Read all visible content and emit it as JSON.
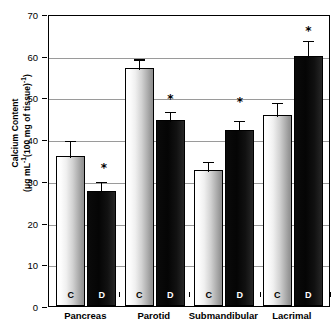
{
  "chart_data": {
    "type": "bar",
    "title": "",
    "xlabel": "",
    "ylabel_line1": "Calcium Content",
    "ylabel_line2_prefix": "(μg mL",
    "ylabel_line2_sup1": "-1",
    "ylabel_line2_mid": "(100 mg of tissue)",
    "ylabel_line2_sup2": "-1",
    "ylabel_line2_suffix": ")",
    "ylabel_plain": "Calcium Content (μg mL-1(100 mg of tissue)-1)",
    "categories": [
      "Pancreas",
      "Parotid",
      "Submandibular",
      "Lacrimal"
    ],
    "group_labels": [
      "C",
      "D"
    ],
    "ylim": [
      0,
      70
    ],
    "ytick_values": [
      0,
      10,
      20,
      30,
      40,
      50,
      60,
      70
    ],
    "ytick_labels": [
      "0",
      "10",
      "20",
      "30",
      "40",
      "50",
      "60",
      "70"
    ],
    "grid": true,
    "legend_position": "none",
    "series": [
      {
        "name": "C",
        "label": "C",
        "color": "#d2d2d2",
        "values": [
          36.0,
          57.0,
          32.5,
          45.7
        ],
        "errors": [
          4.0,
          2.6,
          2.5,
          3.5
        ]
      },
      {
        "name": "D",
        "label": "D",
        "color": "#0a0a0a",
        "values": [
          27.7,
          44.5,
          42.3,
          60.0
        ],
        "errors": [
          2.5,
          2.6,
          2.6,
          4.0
        ]
      }
    ],
    "annotations": [
      {
        "text": "*",
        "category": "Pancreas",
        "series": "D",
        "y": 33.5
      },
      {
        "text": "*",
        "category": "Parotid",
        "series": "D",
        "y": 50.0
      },
      {
        "text": "*",
        "category": "Submandibular",
        "series": "D",
        "y": 49.5
      },
      {
        "text": "*",
        "category": "Lacrimal",
        "series": "D",
        "y": 66.5
      }
    ]
  },
  "colors": {
    "axis": "#000000",
    "grid": "#9a9a9a",
    "control_bar": "#d2d2d2",
    "diabetic_bar": "#0a0a0a",
    "background": "#ffffff"
  }
}
